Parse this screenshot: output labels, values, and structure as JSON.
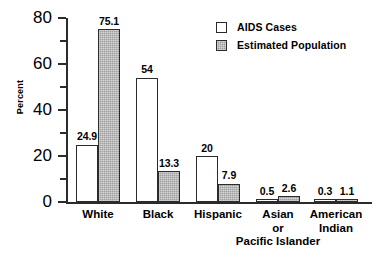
{
  "chart_data": {
    "type": "bar",
    "title": "",
    "xlabel": "",
    "ylabel": "Percent",
    "ylim": [
      0,
      80
    ],
    "ytick_labels": [
      "80",
      "60",
      "40",
      "20",
      "0"
    ],
    "ytick_values": [
      80,
      60,
      40,
      20,
      0
    ],
    "yminor_values": [
      70,
      50,
      30,
      10
    ],
    "grid": false,
    "legend_position": "top-right",
    "categories": [
      "White",
      "Black",
      "Hispanic",
      "Asian\nor\nPacific Islander",
      "American\nIndian"
    ],
    "category_lines": [
      [
        "White"
      ],
      [
        "Black"
      ],
      [
        "Hispanic"
      ],
      [
        "Asian",
        "or",
        "Pacific Islander"
      ],
      [
        "American",
        "Indian"
      ]
    ],
    "series": [
      {
        "name": "AIDS Cases",
        "color": "#ffffff",
        "values": [
          24.9,
          54,
          20,
          0.5,
          0.3
        ],
        "labels": [
          "24.9",
          "54",
          "20",
          "0.5",
          "0.3"
        ]
      },
      {
        "name": "Estimated Population",
        "color": "#9e9e9e",
        "values": [
          75.1,
          13.3,
          7.9,
          2.6,
          1.1
        ],
        "labels": [
          "75.1",
          "13.3",
          "7.9",
          "2.6",
          "1.1"
        ]
      }
    ]
  },
  "legend": {
    "items": [
      {
        "label": "AIDS Cases",
        "swatch": "white"
      },
      {
        "label": "Estimated Population",
        "swatch": "gray"
      }
    ]
  },
  "axis": {
    "y_title": "Percent"
  },
  "colors": {
    "axis": "#2b2b2b",
    "bar_cases": "#ffffff",
    "bar_population": "#9e9e9e",
    "text": "#000000",
    "background": "#ffffff"
  }
}
